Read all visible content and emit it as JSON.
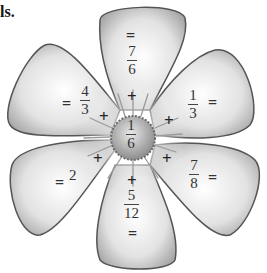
{
  "header": {
    "text": "ls."
  },
  "center": {
    "numerator": "1",
    "denominator": "6"
  },
  "operator": "+",
  "equals": "=",
  "petals": [
    {
      "position": "top",
      "numerator": "7",
      "denominator": "6"
    },
    {
      "position": "upper-right",
      "numerator": "1",
      "denominator": "3"
    },
    {
      "position": "lower-right",
      "numerator": "7",
      "denominator": "8"
    },
    {
      "position": "bottom",
      "numerator": "5",
      "denominator": "12"
    },
    {
      "position": "lower-left",
      "value": "2"
    },
    {
      "position": "upper-left",
      "numerator": "4",
      "denominator": "3"
    }
  ],
  "colors": {
    "petal_light": "#f4f4f4",
    "petal_dark": "#8a8a8a",
    "center": "#b5b5b5",
    "outline": "#555555"
  }
}
